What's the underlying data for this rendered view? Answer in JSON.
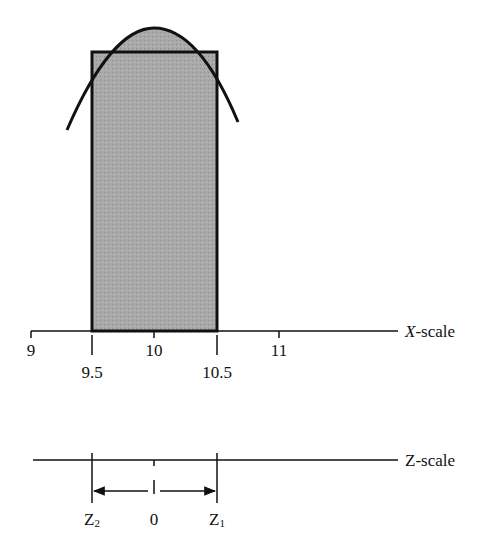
{
  "diagram": {
    "type": "normal-approximation-to-binomial",
    "colors": {
      "ink": "#111111",
      "shade": "#a8a8a8",
      "background": "#ffffff"
    },
    "x_scale": {
      "label_var": "X",
      "label_suffix": "-scale",
      "ticks_upper": [
        {
          "value": "9",
          "x": 31
        },
        {
          "value": "10",
          "x": 154
        },
        {
          "value": "11",
          "x": 279
        }
      ],
      "ticks_lower": [
        {
          "value": "9.5",
          "x": 92
        },
        {
          "value": "10.5",
          "x": 217
        }
      ]
    },
    "bar": {
      "left_value": "9.5",
      "right_value": "10.5",
      "center_value": "10"
    },
    "z_scale": {
      "label": "Z-scale",
      "ticks": [
        {
          "label": "Z",
          "sub": "2",
          "x": 92
        },
        {
          "label": "0",
          "sub": "",
          "x": 154
        },
        {
          "label": "Z",
          "sub": "1",
          "x": 217
        }
      ]
    }
  }
}
